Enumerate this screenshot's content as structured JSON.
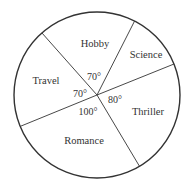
{
  "chart_data": {
    "type": "pie",
    "title": "",
    "slices": [
      {
        "label": "Hobby",
        "angle_deg": 70,
        "angle_label": "70°"
      },
      {
        "label": "Science",
        "angle_deg": 40,
        "angle_label": ""
      },
      {
        "label": "Thriller",
        "angle_deg": 80,
        "angle_label": "80°"
      },
      {
        "label": "Romance",
        "angle_deg": 100,
        "angle_label": "100°"
      },
      {
        "label": "Travel",
        "angle_deg": 70,
        "angle_label": "70°"
      }
    ],
    "colors": {
      "stroke": "#333333",
      "fill": "#ffffff",
      "text": "#333333"
    },
    "legend": "none"
  }
}
